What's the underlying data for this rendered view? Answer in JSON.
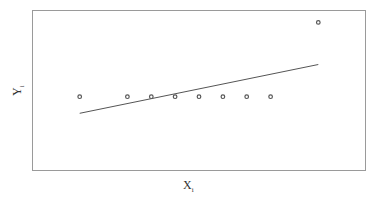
{
  "chart_data": {
    "type": "scatter",
    "title": "",
    "xlabel": "X",
    "xlabel_subscript": "i",
    "ylabel": "Y",
    "ylabel_subscript": "i",
    "axis_ticks": false,
    "grid": false,
    "legend": null,
    "points": [
      {
        "x": 1,
        "y": 1
      },
      {
        "x": 3,
        "y": 1
      },
      {
        "x": 4,
        "y": 1
      },
      {
        "x": 5,
        "y": 1
      },
      {
        "x": 6,
        "y": 1
      },
      {
        "x": 7,
        "y": 1
      },
      {
        "x": 8,
        "y": 1
      },
      {
        "x": 9,
        "y": 1
      },
      {
        "x": 11,
        "y": 4
      }
    ],
    "fit_line": {
      "x0": 1,
      "y0": 0.33,
      "x1": 11,
      "y1": 2.3
    },
    "xlim": [
      -1,
      13
    ],
    "ylim": [
      -2,
      4.5
    ],
    "colors": {
      "frame": "#9a9a9a",
      "points": "#555555",
      "line": "#555555"
    }
  }
}
